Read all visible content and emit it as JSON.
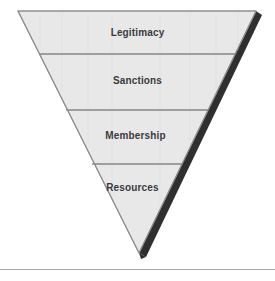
{
  "figure": {
    "type": "inverted-pyramid-funnel",
    "caption_fragment": "Characteristics",
    "background_color": "#ffffff",
    "fill_color": "#e8e8e8",
    "outline_color": "#8f8f93",
    "shadow_color": "#2b2b2b",
    "divider_color": "#555559",
    "label_color": "#3b3b3f",
    "rule_color": "#a8a8ac",
    "bands": [
      {
        "label": "Legitimacy",
        "order": 1,
        "top": 11,
        "bottom": 54,
        "label_y": 27
      },
      {
        "label": "Sanctions",
        "order": 2,
        "top": 54,
        "bottom": 110,
        "label_y": 75
      },
      {
        "label": "Membership",
        "order": 3,
        "top": 110,
        "bottom": 164,
        "label_y": 130
      },
      {
        "label": "Resources",
        "order": 4,
        "top": 164,
        "bottom": 253,
        "label_y": 182
      }
    ],
    "geometry": {
      "top_left_x": 18,
      "top_right_x": 256,
      "top_y": 11,
      "apex_x": 139,
      "apex_y": 253
    },
    "bottom_rule_y": 269
  }
}
